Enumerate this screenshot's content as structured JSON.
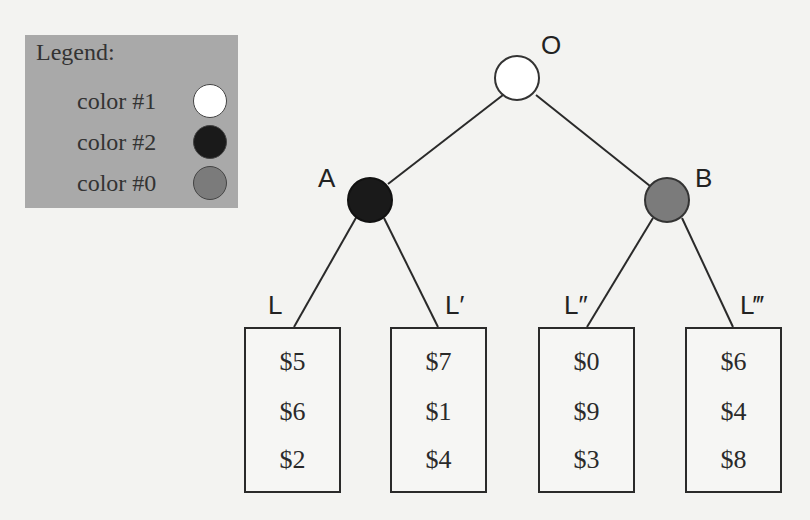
{
  "legend": {
    "title": "Legend:",
    "entries": [
      {
        "label": "color #1",
        "color": "#ffffff"
      },
      {
        "label": "color #2",
        "color": "#1a1a1a"
      },
      {
        "label": "color #0",
        "color": "#7b7b7b"
      }
    ],
    "background": "#a9a9a9"
  },
  "tree": {
    "nodes": [
      {
        "id": "O",
        "label": "O",
        "color": "#ffffff"
      },
      {
        "id": "A",
        "label": "A",
        "color": "#1a1a1a"
      },
      {
        "id": "B",
        "label": "B",
        "color": "#7b7b7b"
      }
    ],
    "edges": [
      [
        "O",
        "A"
      ],
      [
        "O",
        "B"
      ],
      [
        "A",
        "L"
      ],
      [
        "A",
        "L'"
      ],
      [
        "B",
        "L''"
      ],
      [
        "B",
        "L'''"
      ]
    ],
    "leaves": [
      {
        "label": "L",
        "values": [
          "$5",
          "$6",
          "$2"
        ]
      },
      {
        "label": "L′",
        "values": [
          "$7",
          "$1",
          "$4"
        ]
      },
      {
        "label": "L″",
        "values": [
          "$0",
          "$9",
          "$3"
        ]
      },
      {
        "label": "L‴",
        "values": [
          "$6",
          "$4",
          "$8"
        ]
      }
    ]
  }
}
